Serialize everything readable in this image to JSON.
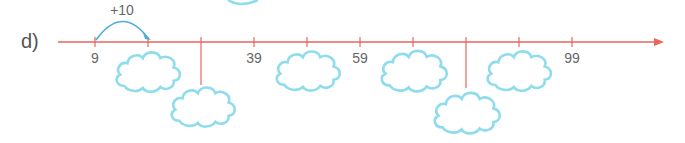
{
  "problem": {
    "label": "d)",
    "jump_label": "+10",
    "start_value": 9,
    "step": 10,
    "axis_color": "#e8665a",
    "arrow_color": "#4aaee0",
    "cloud_color": "#8fdcec",
    "ticks": [
      {
        "value": "9",
        "x": 95,
        "shown": true
      },
      {
        "value": "19",
        "x": 148,
        "shown": false,
        "cloud": "below"
      },
      {
        "value": "29",
        "x": 201,
        "shown": false,
        "cloud": "drop"
      },
      {
        "value": "39",
        "x": 254,
        "shown": true
      },
      {
        "value": "49",
        "x": 307,
        "shown": false,
        "cloud": "below"
      },
      {
        "value": "59",
        "x": 360,
        "shown": true
      },
      {
        "value": "69",
        "x": 413,
        "shown": false,
        "cloud": "below"
      },
      {
        "value": "79",
        "x": 466,
        "shown": false,
        "cloud": "drop"
      },
      {
        "value": "89",
        "x": 519,
        "shown": false,
        "cloud": "below"
      },
      {
        "value": "99",
        "x": 572,
        "shown": true
      }
    ]
  },
  "tick_labels": {
    "t0": "9",
    "t3": "39",
    "t5": "59",
    "t9": "99"
  }
}
